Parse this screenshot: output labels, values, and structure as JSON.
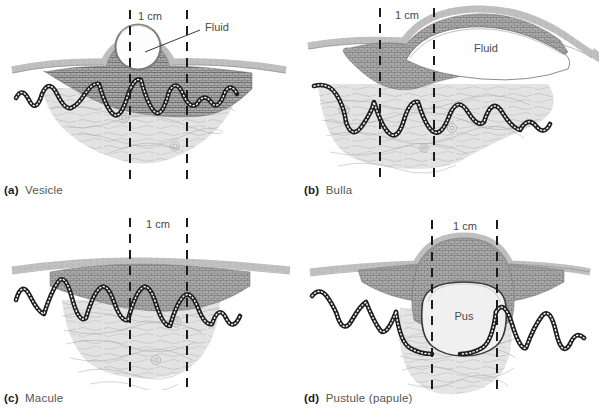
{
  "figure": {
    "background_color": "#ffffff",
    "ink_color": "#4a4a4a",
    "layout": "2x2 grid of skin cross-section panels"
  },
  "scale_label": "1 cm",
  "panels": [
    {
      "id": "a",
      "letter": "(a)",
      "name": "Vesicle",
      "caption": "(a) Vesicle",
      "scale_label": "1 cm",
      "callout_label": "Fluid",
      "has_callout_leader": true,
      "cavity_label": "Fluid",
      "description": "Small rounded fluid-filled blister raised above epidermis",
      "measure_lines_x": [
        130,
        187
      ]
    },
    {
      "id": "b",
      "letter": "(b)",
      "name": "Bulla",
      "caption": "(b) Bulla",
      "scale_label": "1 cm",
      "callout_label": "Fluid",
      "has_callout_leader": false,
      "cavity_label": "Fluid",
      "description": "Large flattened fluid-filled blister spanning wide area of epidermis",
      "measure_lines_x": [
        80,
        134
      ]
    },
    {
      "id": "c",
      "letter": "(c)",
      "name": "Macule",
      "caption": "(c) Macule",
      "scale_label": "1 cm",
      "callout_label": "",
      "has_callout_leader": false,
      "cavity_label": "",
      "description": "Flat discoloured area, no elevation or fluid cavity",
      "measure_lines_x": [
        130,
        187
      ]
    },
    {
      "id": "d",
      "letter": "(d)",
      "name": "Pustule (papule)",
      "caption": "(d) Pustule (papule)",
      "scale_label": "1 cm",
      "callout_label": "Pus",
      "has_callout_leader": false,
      "cavity_label": "Pus",
      "description": "Raised dome-shaped lesion containing pus in the dermis",
      "measure_lines_x": [
        132,
        197
      ]
    }
  ],
  "skin_layers": [
    {
      "name": "stratum-corneum",
      "style": "fine hatched lines",
      "color": "#8d8d8d"
    },
    {
      "name": "epidermis",
      "style": "stippled cobblestone cells",
      "color": "#9a9a9a"
    },
    {
      "name": "dermo-epidermal-junction",
      "style": "beaded wavy chain",
      "color": "#2a2a2a"
    },
    {
      "name": "dermis",
      "style": "wavy collagen fibres",
      "color": "#d8d8d8"
    }
  ]
}
